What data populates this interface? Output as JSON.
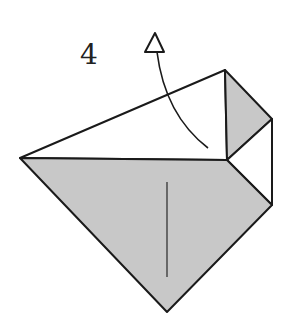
{
  "diagram": {
    "type": "origami-step",
    "step_number": "4",
    "colors": {
      "paper_colored": "#c8c8c8",
      "paper_white": "#ffffff",
      "line": "#1a1a1a"
    },
    "arrow": {
      "kind": "hollow-head-curved",
      "direction": "up",
      "meaning": "fold up / lift flap"
    }
  }
}
